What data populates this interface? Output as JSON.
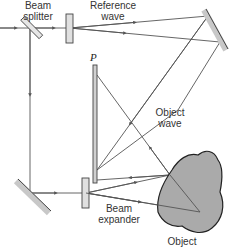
{
  "labels": {
    "beam_splitter_line1": "Beam",
    "beam_splitter_line2": "splitter",
    "reference_wave_line1": "Reference",
    "reference_wave_line2": "wave",
    "plate": "P",
    "object_wave_line1": "Object",
    "object_wave_line2": "wave",
    "beam_expander_line1": "Beam",
    "beam_expander_line2": "expander",
    "object": "Object"
  },
  "colors": {
    "ray": "#555555",
    "mirror_fill": "#c8c8c8",
    "mirror_edge": "#444444",
    "object_fill": "#a9a9a9",
    "lens_fill": "#e0e0e0"
  }
}
